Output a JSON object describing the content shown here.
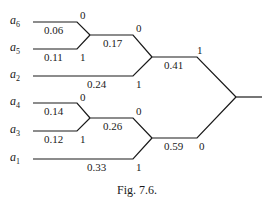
{
  "leaves": [
    {
      "name": "a",
      "sub": "6",
      "prob": "0.06"
    },
    {
      "name": "a",
      "sub": "5",
      "prob": "0.11"
    },
    {
      "name": "a",
      "sub": "2",
      "prob": "0.24"
    },
    {
      "name": "a",
      "sub": "4",
      "prob": "0.14"
    },
    {
      "name": "a",
      "sub": "3",
      "prob": "0.12"
    },
    {
      "name": "a",
      "sub": "1",
      "prob": "0.33"
    }
  ],
  "internal_nodes": {
    "n65": "0.17",
    "n652": "0.41",
    "n43": "0.26",
    "n431": "0.59"
  },
  "bits": {
    "a6": "0",
    "a5": "1",
    "n65": "0",
    "a2": "1",
    "a4": "0",
    "a3": "1",
    "n43": "0",
    "a1": "1",
    "n652": "1",
    "n431": "0"
  },
  "caption": "Fig. 7.6."
}
